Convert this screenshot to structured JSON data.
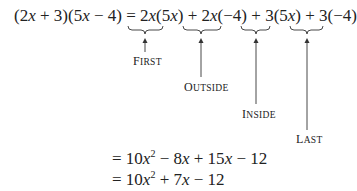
{
  "equation": {
    "lhs": "(2x + 3)(5x − 4)",
    "equals": "=",
    "terms": [
      {
        "text": "2x(5x)",
        "label": "First"
      },
      {
        "text": "2x(−4)",
        "label": "Outside"
      },
      {
        "text": "3(5x)",
        "label": "Inside"
      },
      {
        "text": "3(−4)",
        "label": "Last"
      }
    ],
    "plus": "+"
  },
  "steps": [
    "= 10x² − 8x + 15x − 12",
    "= 10x² + 7x − 12"
  ],
  "labels": {
    "first_initial": "F",
    "first_rest": "IRST",
    "outside_initial": "O",
    "outside_rest": "UTSIDE",
    "inside_initial": "I",
    "inside_rest": "NSIDE",
    "last_initial": "L",
    "last_rest": "AST"
  }
}
